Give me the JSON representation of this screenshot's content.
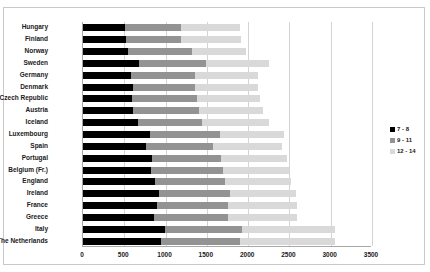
{
  "chart_data": {
    "type": "bar",
    "subtype": "horizontal-stacked-bar",
    "title": "",
    "xlabel": "",
    "ylabel": "",
    "xlim": [
      0,
      3500
    ],
    "xticks": [
      0,
      500,
      1000,
      1500,
      2000,
      2500,
      3000,
      3500
    ],
    "xtick_labels": [
      "0",
      "500",
      "1000",
      "1500",
      "2000",
      "2500",
      "3000",
      "3500"
    ],
    "grid": true,
    "grid_axis": "x",
    "legend_position": "right",
    "categories": [
      "Hungary",
      "Finland",
      "Norway",
      "Sweden",
      "Germany",
      "Denmark",
      "Czech Republic",
      "Austria",
      "Iceland",
      "Luxembourg",
      "Spain",
      "Portugal",
      "Belgium (Fr.)",
      "England",
      "Ireland",
      "France",
      "Greece",
      "Italy",
      "The Netherlands"
    ],
    "series": [
      {
        "name": "7 - 8",
        "color": "#000000",
        "values": [
          510,
          525,
          540,
          680,
          580,
          600,
          595,
          605,
          665,
          810,
          760,
          840,
          820,
          870,
          925,
          900,
          855,
          990,
          940
        ]
      },
      {
        "name": "9 - 11",
        "color": "#939393",
        "values": [
          680,
          660,
          775,
          810,
          780,
          760,
          790,
          800,
          780,
          845,
          820,
          830,
          870,
          850,
          860,
          860,
          905,
          940,
          960
        ]
      },
      {
        "name": "12 - 14",
        "color": "#d9d9d9",
        "values": [
          710,
          725,
          665,
          760,
          765,
          760,
          760,
          775,
          805,
          785,
          830,
          800,
          800,
          800,
          790,
          830,
          830,
          1120,
          1150
        ]
      }
    ],
    "totals": [
      1900,
      1910,
      1980,
      2250,
      2125,
      2120,
      2145,
      2180,
      2250,
      2440,
      2410,
      2470,
      2490,
      2520,
      2575,
      2590,
      2590,
      3050,
      3050
    ]
  },
  "legend": {
    "items": [
      {
        "label": "7 - 8",
        "color": "#000000"
      },
      {
        "label": "9 - 11",
        "color": "#939393"
      },
      {
        "label": "12 - 14",
        "color": "#d9d9d9"
      }
    ]
  }
}
